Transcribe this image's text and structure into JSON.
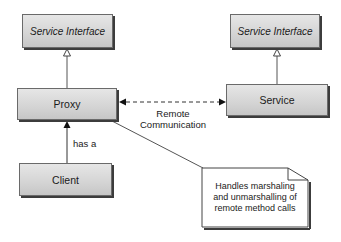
{
  "diagram": {
    "type": "UML class diagram - Proxy pattern",
    "nodes": {
      "service_interface_left": {
        "label": "Service Interface",
        "style": "italic"
      },
      "service_interface_right": {
        "label": "Service Interface",
        "style": "italic"
      },
      "proxy": {
        "label": "Proxy"
      },
      "service": {
        "label": "Service"
      },
      "client": {
        "label": "Client"
      }
    },
    "edges": [
      {
        "from": "proxy",
        "to": "service_interface_left",
        "kind": "generalization"
      },
      {
        "from": "service",
        "to": "service_interface_right",
        "kind": "generalization"
      },
      {
        "from": "client",
        "to": "proxy",
        "kind": "association",
        "label": "has a"
      },
      {
        "from": "proxy",
        "to": "service",
        "kind": "bidirectional-dashed",
        "label_line1": "Remote",
        "label_line2": "Communication"
      },
      {
        "from": "note",
        "to": "proxy",
        "kind": "note-anchor"
      }
    ],
    "labels": {
      "has_a": "has a",
      "remote_line1": "Remote",
      "remote_line2": "Communication"
    },
    "note": {
      "line1": "Handles marshaling",
      "line2": "and unmarshalling of",
      "line3": "remote method calls"
    },
    "colors": {
      "box_fill_top": "#e6e6e6",
      "box_fill_bottom": "#c6c6c6",
      "box_border": "#6a6a6a",
      "shadow": "#3c3c3c",
      "line": "#555555"
    }
  }
}
